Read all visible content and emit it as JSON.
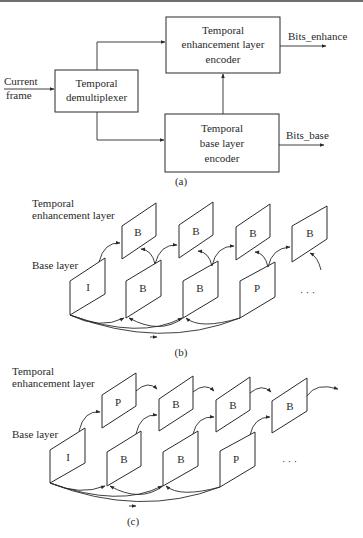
{
  "figure_a": {
    "caption": "(a)",
    "input_label": [
      "Current",
      "frame"
    ],
    "blocks": {
      "demux": {
        "lines": [
          "Temporal",
          "demultiplexer"
        ],
        "x": 55,
        "y": 70,
        "w": 83,
        "h": 42
      },
      "enhance_encoder": {
        "lines": [
          "Temporal",
          "enhancement layer",
          "encoder"
        ],
        "x": 166,
        "y": 17,
        "w": 114,
        "h": 56
      },
      "base_encoder": {
        "lines": [
          "Temporal",
          "base layer",
          "encoder"
        ],
        "x": 165,
        "y": 114,
        "w": 114,
        "h": 58
      }
    },
    "outputs": {
      "enhance": "Bits_enhance",
      "base": "Bits_base"
    }
  },
  "figure_b": {
    "caption": "(b)",
    "enhancement_label": [
      "Temporal",
      "enhancement layer"
    ],
    "base_label": "Base layer",
    "enhancement_frames": [
      "B",
      "B",
      "B",
      "B"
    ],
    "base_frames": [
      "I",
      "B",
      "B",
      "P"
    ],
    "ellipsis": "· · ·"
  },
  "figure_c": {
    "caption": "(c)",
    "enhancement_label": [
      "Temporal",
      "enhancement layer"
    ],
    "base_label": "Base layer",
    "enhancement_frames": [
      "P",
      "B",
      "B",
      "B"
    ],
    "base_frames": [
      "I",
      "B",
      "B",
      "P"
    ],
    "ellipsis": "· · ·"
  },
  "colors": {
    "ink": "#2a2a2a",
    "paper": "#ffffff",
    "rule": "#6f6f6f"
  }
}
